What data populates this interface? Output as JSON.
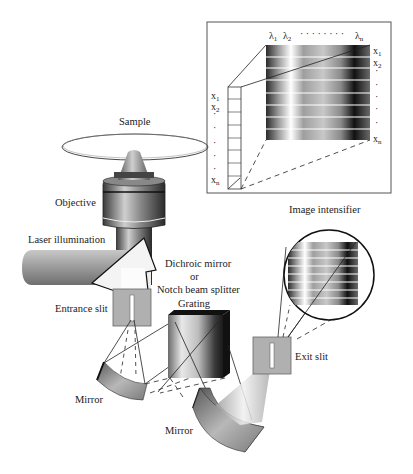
{
  "figure": {
    "labels": {
      "sample": "Sample",
      "objective": "Objective",
      "laser": "Laser illumination",
      "dichroic_line1": "Dichroic mirror",
      "dichroic_line2": "or",
      "dichroic_line3": "Notch beam splitter",
      "entrance_slit": "Entrance slit",
      "grating": "Grating",
      "exit_slit": "Exit slit",
      "image_intensifier": "Image intensifier",
      "mirror1": "Mirror",
      "mirror2": "Mirror"
    },
    "inset": {
      "lambda_labels": [
        "λ",
        "λ",
        "λ"
      ],
      "lambda_subs": [
        "1",
        "2",
        "n"
      ],
      "lambda_dots": "· · · · · · · ·",
      "x_right": [
        "x",
        "x",
        "x"
      ],
      "x_right_subs": [
        "1",
        "2",
        "n"
      ],
      "x_left": [
        "x",
        "x",
        "x"
      ],
      "x_left_subs": [
        "1",
        "2",
        "n"
      ],
      "dot": "·"
    },
    "colors": {
      "line": "#222222",
      "slit_box": "#b0b0b0",
      "beam": "#9a9a9a",
      "dark": "#111111"
    }
  }
}
